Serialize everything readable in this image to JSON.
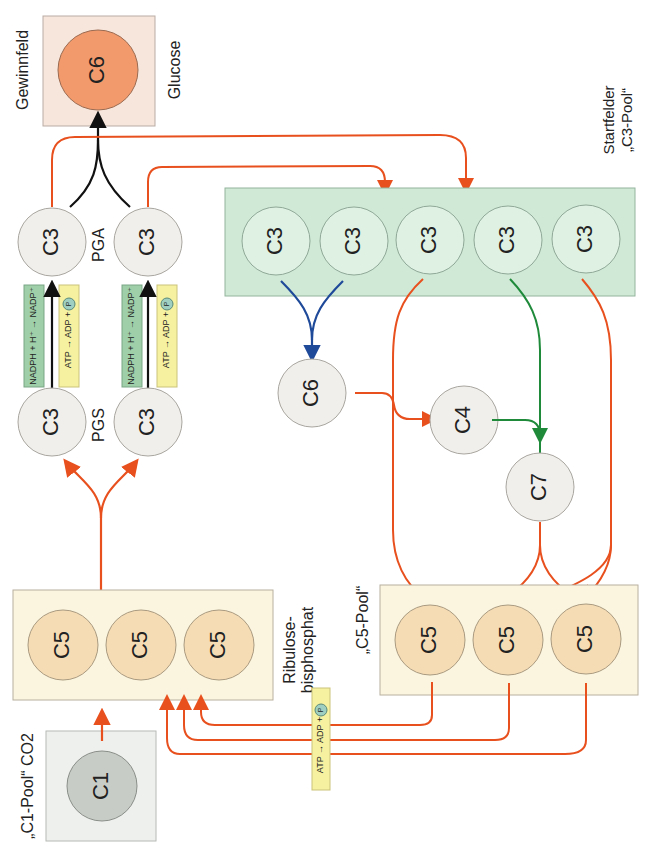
{
  "labels": {
    "gewinnfeld": "Gewinnfeld",
    "glucose": "Glucose",
    "pga": "PGA",
    "pgs": "PGS",
    "startfelder": "Startfelder",
    "c3_pool": "„C3-Pool“",
    "ribulose1": "Ribulose-",
    "ribulose2": "bisphosphat",
    "c5_pool": "„C5-Pool“",
    "c1_pool": "„C1-Pool“ CO2"
  },
  "molecules": {
    "glucose": "C6",
    "pga": [
      "C3",
      "C3"
    ],
    "pgs": [
      "C3",
      "C3"
    ],
    "c3_pool": [
      "C3",
      "C3",
      "C3",
      "C3",
      "C3"
    ],
    "c6_mid": "C6",
    "c4": "C4",
    "c7": "C7",
    "rubp": [
      "C5",
      "C5",
      "C5"
    ],
    "c5_pool": [
      "C5",
      "C5",
      "C5"
    ],
    "c1": "C1"
  },
  "reactions": {
    "nadph": "NADPH + H⁺ → NADP⁺",
    "atp": "ATP → ADP + ",
    "phosphate": "P"
  },
  "colors": {
    "orange_arrow": "#e8501e",
    "black_arrow": "#111111",
    "blue_arrow": "#1f4a9a",
    "green_arrow": "#1e8a3a",
    "glucose_fill": "#f39a6c",
    "c3_pool_box": "#cfe9d6",
    "c5_box": "#fbf5df",
    "c5_circle": "#f6dcb4",
    "pale_circle": "#f1efeb",
    "c1_box": "#eef0ee",
    "c1_circle": "#c8ccc6",
    "nadph_box": "#9fcfa8",
    "atp_box": "#f5f1a0"
  }
}
